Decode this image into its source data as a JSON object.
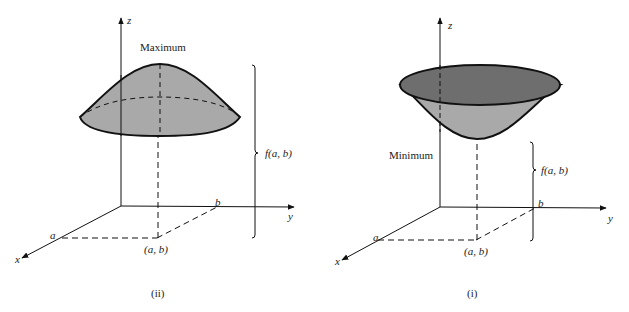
{
  "figures": [
    {
      "id": "ii",
      "caption": "(ii)",
      "title": "Maximum",
      "height_label": "f(a, b)",
      "point_label": "(a, b)",
      "axis_labels": {
        "x": "x",
        "y": "y",
        "z": "z"
      },
      "tick_labels": {
        "a": "a",
        "b": "b"
      }
    },
    {
      "id": "i",
      "caption": "(i)",
      "title": "Minimum",
      "height_label": "f(a, b)",
      "point_label": "(a, b)",
      "axis_labels": {
        "x": "x",
        "y": "y",
        "z": "z"
      },
      "tick_labels": {
        "a": "a",
        "b": "b"
      }
    }
  ],
  "colors": {
    "surface_light": "#a9a9a9",
    "surface_dark": "#6e6e6e",
    "line": "#111111"
  }
}
